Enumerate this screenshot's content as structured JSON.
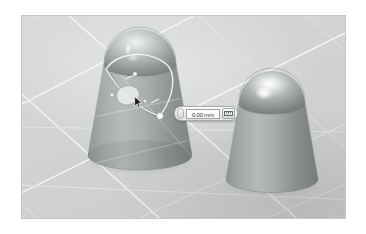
{
  "app": {
    "kind": "3d-modeling-viewport",
    "view_label": "",
    "background_color": "#d4d6d6",
    "grid_line_color": "#eceeee",
    "surface_color": "#9a9d9d",
    "highlight_color": "#ffffff"
  },
  "viewport": {
    "name": "3d-viewport",
    "objects": [
      {
        "id": "cone-left",
        "name": "truncated-cone-selected",
        "selected": true,
        "transparent": true,
        "has_dome_cap": true,
        "has_manipulator": true
      },
      {
        "id": "cone-right",
        "name": "truncated-cone",
        "selected": false,
        "transparent": false,
        "has_dome_cap": true,
        "has_manipulator": false
      }
    ]
  },
  "manipulator": {
    "name": "rotation-manipulator",
    "handle_count": 4,
    "arc_visible": true
  },
  "dimension_editor": {
    "name": "dimension-input",
    "value": "0.00 mm",
    "placeholder": "0.00 mm",
    "unit_button_label": "",
    "unit_icon": "ruler-icon",
    "drag_grip_icon": "drag-grip-icon"
  },
  "cursor": {
    "name": "mouse-cursor",
    "icon": "arrow-pointer-icon",
    "x": 112,
    "y": 80
  }
}
